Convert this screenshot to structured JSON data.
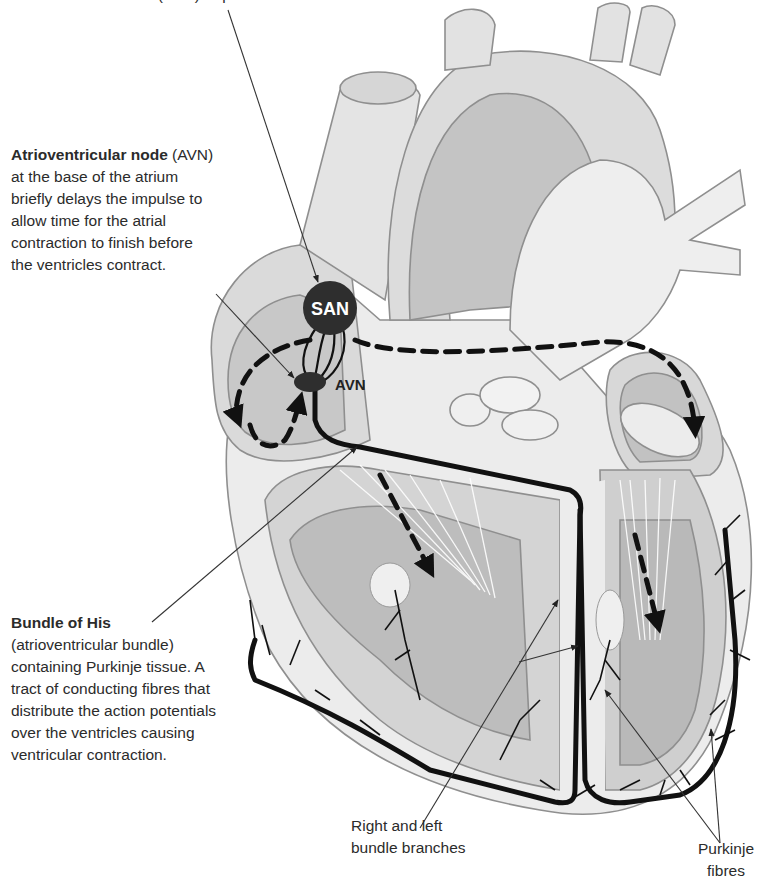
{
  "diagram": {
    "title_cutoff": "Sinoatrial node (SAN) or pacemaker",
    "nodes": {
      "san": "SAN",
      "avn": "AVN"
    },
    "labels": {
      "avn": {
        "heading_bold": "Atrioventricular node",
        "heading_rest": " (AVN)",
        "lines": [
          "at the base of the atrium",
          "briefly delays the impulse to",
          "allow time for the atrial",
          "contraction to finish before",
          "the ventricles contract."
        ]
      },
      "bundle_of_his": {
        "heading_bold": "Bundle of His",
        "lines": [
          "(atrioventricular bundle)",
          "containing Purkinje tissue. A",
          "tract of conducting fibres that",
          "distribute the action potentials",
          "over the ventricles causing",
          "ventricular contraction."
        ]
      },
      "bundle_branches": {
        "lines": [
          "Right and left",
          "bundle branches"
        ]
      },
      "purkinje": {
        "lines": [
          "Purkinje",
          "fibres"
        ]
      }
    },
    "colors": {
      "background": "#ffffff",
      "tissue_light": "#ececec",
      "tissue_mid": "#d2d2d2",
      "tissue_dark": "#b4b4b4",
      "outline": "#8f8f8f",
      "conduction": "#111111",
      "node_fill": "#2e2e2e",
      "text": "#2b2b2b"
    }
  }
}
